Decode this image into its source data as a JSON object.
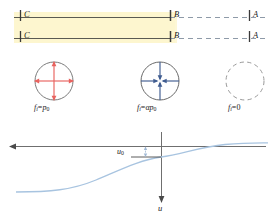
{
  "figure": {
    "type": "diagram",
    "colors": {
      "band_highlight": "#fdf6cf",
      "solid_line": "#5a5a52",
      "dashed_line": "#8e9aa8",
      "circle_outward": "#e8635f",
      "circle_inward": "#3f5c90",
      "circle_neutral": "#9a9a9a",
      "curve": "#a8c4e0",
      "axis": "#6f6f6f",
      "text": "#1a1a1a"
    }
  },
  "top_panel": {
    "name": "front-propagation-schematic",
    "region_labels": [
      {
        "id": "C-upper",
        "text": "C",
        "x": 24,
        "y": 10
      },
      {
        "id": "C-lower",
        "text": "C",
        "x": 24,
        "y": 31
      },
      {
        "id": "B-upper",
        "text": "B",
        "x": 175,
        "y": 10
      },
      {
        "id": "B-lower",
        "text": "B",
        "x": 175,
        "y": 31
      },
      {
        "id": "A-upper",
        "text": "A",
        "x": 253,
        "y": 10
      },
      {
        "id": "A-lower",
        "text": "A",
        "x": 253,
        "y": 31
      }
    ],
    "solid_span": {
      "x1": 14,
      "x2": 170
    },
    "dashed_span": {
      "x1": 170,
      "x2": 268
    },
    "line_rows_y": [
      17,
      38
    ],
    "highlight_band": {
      "x": 14,
      "y": 12,
      "width": 160,
      "height": 31
    }
  },
  "states": [
    {
      "name": "state-C-expansion",
      "center_x": 54,
      "center_y": 81,
      "radius": 19,
      "stroke": "solid",
      "arrows": "outward",
      "arrow_color": "#e8635f",
      "equation": {
        "fn": "f",
        "fn_sub": "i",
        "rel": "=",
        "rhs": "p",
        "rhs_sub": "0"
      },
      "equation_text": "f i = p 0",
      "equation_x": 54,
      "equation_y": 108
    },
    {
      "name": "state-B-compression",
      "center_x": 160,
      "center_y": 81,
      "radius": 19,
      "stroke": "solid",
      "arrows": "inward",
      "arrow_color": "#3f5c90",
      "equation": {
        "fn": "f",
        "fn_sub": "i",
        "rel": "=",
        "rhs": "αp",
        "rhs_sub": "0"
      },
      "equation_text": "f i = alpha p 0",
      "equation_x": 160,
      "equation_y": 108
    },
    {
      "name": "state-A-unloaded",
      "center_x": 245,
      "center_y": 81,
      "radius": 19,
      "stroke": "dashed",
      "arrows": "none",
      "arrow_color": "#9a9a9a",
      "equation": {
        "fn": "f",
        "fn_sub": "i",
        "rel": "=",
        "rhs": "0",
        "rhs_sub": ""
      },
      "equation_text": "f i = 0",
      "equation_x": 245,
      "equation_y": 108
    }
  ],
  "bottom_panel": {
    "name": "displacement-profile-plot",
    "horizontal_axis": {
      "name": "x-axis",
      "y": 146,
      "x_from": 268,
      "x_to": 10,
      "arrow_at": "left",
      "label": ""
    },
    "vertical_axis": {
      "name": "u-axis",
      "x": 161,
      "y_from": 132,
      "y_to": 202,
      "arrow_at": "bottom",
      "label": "u",
      "label_x": 161,
      "label_y": 206
    },
    "offset_marker": {
      "name": "u0-offset",
      "label": "u",
      "label_sub": "0",
      "label_x": 118,
      "label_y": 150,
      "leader_x1": 131,
      "leader_x2": 161,
      "leader_y": 157,
      "tick_x": 145,
      "tick_y1": 146,
      "tick_y2": 157
    },
    "curve": {
      "name": "displacement-curve",
      "shape": "sigmoid",
      "color": "#a8c4e0",
      "left_asymptote_y": 192,
      "right_asymptote_y": 143,
      "inflection_x": 161,
      "inflection_y": 157,
      "x_start": 16,
      "x_end": 268
    }
  }
}
